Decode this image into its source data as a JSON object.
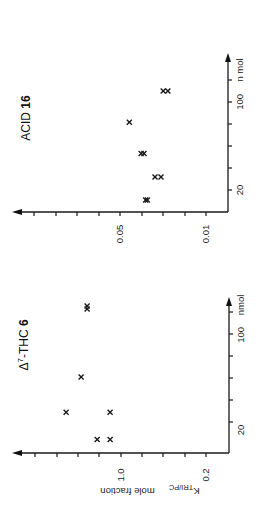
{
  "figure": {
    "orientation": "rotated 90 degrees counter-clockwise"
  },
  "chart_data": [
    {
      "type": "scatter",
      "title": "Δ7-THC 6",
      "title_parts": {
        "prefix": "Δ",
        "sup": "7",
        "mid": "-THC ",
        "bold": "6"
      },
      "xlabel": "nmol",
      "ylabel": "K TRI/PC mole fraction",
      "ylabel_parts": {
        "k": "K",
        "sub": "TRI/PC",
        "rest": "mole  fraction"
      },
      "xscale": "log",
      "yscale": "log",
      "x_ticks_labeled": [
        {
          "value": 20,
          "label": "20"
        },
        {
          "value": 100,
          "label": "100"
        }
      ],
      "y_ticks_labeled": [
        {
          "value": 0.2,
          "label": "0.2"
        },
        {
          "value": 1.0,
          "label": "1.0"
        }
      ],
      "x_unit_label": "nmol",
      "xlim": [
        14,
        240
      ],
      "ylim": [
        0.13,
        4.3
      ],
      "grid": false,
      "marker": "x",
      "points": [
        {
          "x": 17,
          "y": 1.57
        },
        {
          "x": 17,
          "y": 1.23
        },
        {
          "x": 27,
          "y": 2.83
        },
        {
          "x": 27,
          "y": 1.23
        },
        {
          "x": 49,
          "y": 2.13
        },
        {
          "x": 155,
          "y": 1.9
        },
        {
          "x": 163,
          "y": 1.9
        }
      ]
    },
    {
      "type": "scatter",
      "title": "ACID 16",
      "title_parts": {
        "prefix": "",
        "sup": "",
        "mid": "ACID ",
        "bold": "16"
      },
      "xlabel": "nmol",
      "ylabel": "",
      "xscale": "log",
      "yscale": "log",
      "x_ticks_labeled": [
        {
          "value": 20,
          "label": "20"
        },
        {
          "value": 100,
          "label": "100"
        }
      ],
      "y_ticks_labeled": [
        {
          "value": 0.01,
          "label": "0.01"
        },
        {
          "value": 0.05,
          "label": "0.05"
        }
      ],
      "x_unit_label": "n mol",
      "xlim": [
        14,
        240
      ],
      "ylim": [
        0.0065,
        0.21
      ],
      "grid": false,
      "marker": "x",
      "points": [
        {
          "x": 16.7,
          "y": 0.031
        },
        {
          "x": 16.7,
          "y": 0.03
        },
        {
          "x": 25.4,
          "y": 0.026
        },
        {
          "x": 25.4,
          "y": 0.0232
        },
        {
          "x": 39,
          "y": 0.0337
        },
        {
          "x": 39,
          "y": 0.0319
        },
        {
          "x": 69,
          "y": 0.042
        },
        {
          "x": 122,
          "y": 0.0223
        },
        {
          "x": 122,
          "y": 0.0204
        }
      ]
    }
  ]
}
